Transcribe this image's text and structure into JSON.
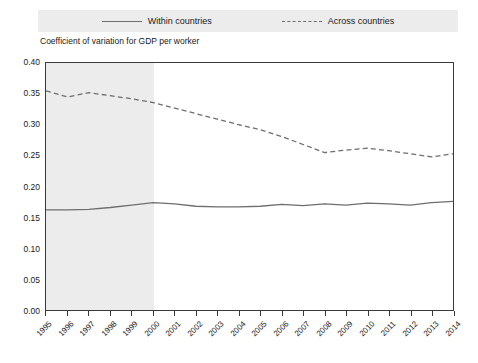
{
  "legend": {
    "position": "top",
    "items": [
      {
        "label": "Within countries",
        "style": "solid",
        "color": "#6e6e6e"
      },
      {
        "label": "Across countries",
        "style": "dashed",
        "color": "#6e6e6e"
      }
    ]
  },
  "axis_title": "Coefficient of variation for GDP per worker",
  "chart_data": {
    "type": "line",
    "title": "",
    "subtitle": "Coefficient of variation for GDP per worker",
    "xlabel": "",
    "ylabel": "Coefficient of variation for GDP per worker",
    "xlim": [
      1995,
      2014
    ],
    "ylim": [
      0.0,
      0.4
    ],
    "grid": false,
    "legend_position": "top",
    "x": [
      1995,
      1996,
      1997,
      1998,
      1999,
      2000,
      2001,
      2002,
      2003,
      2004,
      2005,
      2006,
      2007,
      2008,
      2009,
      2010,
      2011,
      2012,
      2013,
      2014
    ],
    "xticklabels": [
      "1995",
      "1996",
      "1997",
      "1998",
      "1999",
      "2000",
      "2001",
      "2002",
      "2003",
      "2004",
      "2005",
      "2006",
      "2007",
      "2008",
      "2009",
      "2010",
      "2011",
      "2012",
      "2013",
      "2014"
    ],
    "yticks": [
      0.0,
      0.05,
      0.1,
      0.15,
      0.2,
      0.25,
      0.3,
      0.35,
      0.4
    ],
    "yticklabels": [
      "0.00",
      "0.05",
      "0.10",
      "0.15",
      "0.20",
      "0.25",
      "0.30",
      "0.35",
      "0.40"
    ],
    "shaded_region": {
      "x_start": 1995,
      "x_end": 2000,
      "color": "#ececec"
    },
    "series": [
      {
        "name": "Within countries",
        "style": "solid",
        "color": "#6e6e6e",
        "values": [
          0.162,
          0.162,
          0.163,
          0.166,
          0.17,
          0.174,
          0.172,
          0.168,
          0.167,
          0.167,
          0.168,
          0.171,
          0.169,
          0.172,
          0.17,
          0.173,
          0.172,
          0.17,
          0.174,
          0.176
        ]
      },
      {
        "name": "Across countries",
        "style": "dashed",
        "color": "#6e6e6e",
        "values": [
          0.355,
          0.345,
          0.352,
          0.347,
          0.342,
          0.336,
          0.327,
          0.318,
          0.309,
          0.3,
          0.292,
          0.281,
          0.268,
          0.255,
          0.259,
          0.262,
          0.258,
          0.253,
          0.248,
          0.253
        ]
      }
    ]
  }
}
